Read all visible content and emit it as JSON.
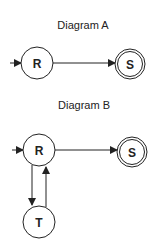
{
  "diagram_a": {
    "title": "Diagram A",
    "states": [
      {
        "id": "R",
        "label": "R",
        "start": true,
        "accept": false
      },
      {
        "id": "S",
        "label": "S",
        "start": false,
        "accept": true
      }
    ],
    "transitions": [
      {
        "from": "R",
        "to": "S"
      }
    ]
  },
  "diagram_b": {
    "title": "Diagram B",
    "states": [
      {
        "id": "R",
        "label": "R",
        "start": true,
        "accept": false
      },
      {
        "id": "S",
        "label": "S",
        "start": false,
        "accept": true
      },
      {
        "id": "T",
        "label": "T",
        "start": false,
        "accept": false
      }
    ],
    "transitions": [
      {
        "from": "R",
        "to": "S"
      },
      {
        "from": "R",
        "to": "T"
      },
      {
        "from": "T",
        "to": "R"
      }
    ]
  },
  "colors": {
    "stroke": "#222222",
    "background": "#ffffff"
  }
}
